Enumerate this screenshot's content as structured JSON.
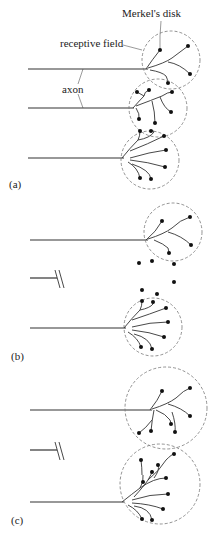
{
  "figure": {
    "labels": {
      "merkels_disk": "Merkel's disk",
      "receptive_field": "receptive field",
      "axon": "axon"
    },
    "panels": [
      {
        "id": "a",
        "label": "(a)",
        "description": "Three axons with overlapping receptive fields"
      },
      {
        "id": "b",
        "label": "(b)",
        "description": "Middle axon severed; its Merkel's disks left isolated between neighboring receptive fields"
      },
      {
        "id": "c",
        "label": "(c)",
        "description": "Neighboring axons sprout and enlarge receptive fields to reinnervate orphaned disks"
      }
    ]
  }
}
